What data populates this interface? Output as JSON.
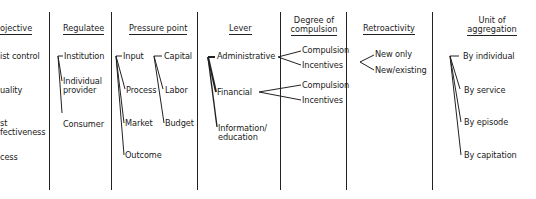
{
  "columns": [
    {
      "header": "Objective",
      "header_visible": "ojective",
      "items": [
        "Cost control",
        "Quality",
        "Cost effectiveness",
        "Access"
      ],
      "items_visible": [
        "ist control",
        "uality",
        "st",
        "fectiveness",
        "cess"
      ]
    },
    {
      "header": "Regulatee",
      "items": [
        "Institution",
        "Individual",
        "provider",
        "Consumer"
      ]
    },
    {
      "header": "Pressure point",
      "items": [
        "Input",
        "Process",
        "Market",
        "Outcome"
      ],
      "sub_items": [
        "Capital",
        "Labor",
        "Budget"
      ]
    },
    {
      "header": "Lever",
      "items": [
        "Administrative",
        "Financial",
        "Information/",
        "education"
      ]
    },
    {
      "header_line1": "Degree of",
      "header_line2": "compulsion",
      "items": [
        "Compulsion",
        "Incentives",
        "Compulsion",
        "Incentives"
      ]
    },
    {
      "header": "Retroactivity",
      "items": [
        "New only",
        "New/existing"
      ]
    },
    {
      "header_line1": "Unit of",
      "header_line2": "aggregation",
      "items": [
        "By individual",
        "By service",
        "By episode",
        "By capitation"
      ]
    }
  ]
}
